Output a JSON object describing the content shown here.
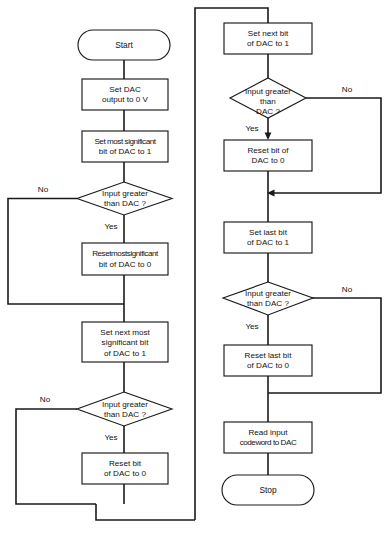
{
  "diagram": {
    "type": "flowchart",
    "colors": {
      "background": "#ffffff",
      "stroke": "#1a1a1a",
      "text": "#111111"
    }
  },
  "nodes": {
    "start": {
      "kind": "terminal",
      "label": "Start"
    },
    "set_dac_zero": {
      "kind": "process",
      "line1": "Set DAC",
      "line2": "output to 0 V"
    },
    "set_msb": {
      "kind": "process",
      "line1": "Set most significant",
      "line2": "bit of DAC to 1"
    },
    "decide_msb": {
      "kind": "decision",
      "line1": "Input greater",
      "line2": "than DAC ?"
    },
    "reset_msb": {
      "kind": "process",
      "line1": "Resetmostsignificant",
      "line2": "bit of DAC to 0"
    },
    "set_next_msb": {
      "kind": "process",
      "line1": "Set next most",
      "line2": "significant bit",
      "line3": "of DAC to 1"
    },
    "decide_next_msb": {
      "kind": "decision",
      "line1": "Input greater",
      "line2": "than DAC ?"
    },
    "reset_bit_left": {
      "kind": "process",
      "line1": "Reset bit",
      "line2": "of DAC to 0"
    },
    "set_next_bit": {
      "kind": "process",
      "line1": "Set next bit",
      "line2": "of DAC to 1"
    },
    "decide_next_bit": {
      "kind": "decision",
      "line1": "Input greater",
      "line2": "than",
      "line3": "DAC ?"
    },
    "reset_bit_right": {
      "kind": "process",
      "line1": "Reset bit of",
      "line2": "DAC to 0"
    },
    "set_last_bit": {
      "kind": "process",
      "line1": "Set last bit",
      "line2": "of DAC to 1"
    },
    "decide_last_bit": {
      "kind": "decision",
      "line1": "Input greater",
      "line2": "than DAC ?"
    },
    "reset_last_bit": {
      "kind": "process",
      "line1": "Reset last bit",
      "line2": "of DAC to 0"
    },
    "read_input": {
      "kind": "process",
      "line1": "Read input",
      "line2": "codeword to DAC"
    },
    "stop": {
      "kind": "terminal",
      "label": "Stop"
    }
  },
  "edge_labels": {
    "no_1": "No",
    "yes_1": "Yes",
    "no_2": "No",
    "yes_2": "Yes",
    "no_3": "No",
    "yes_3": "Yes",
    "no_4": "No",
    "yes_4": "Yes"
  }
}
